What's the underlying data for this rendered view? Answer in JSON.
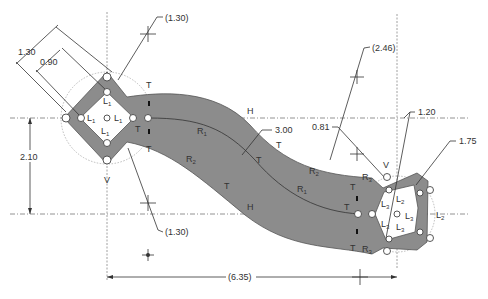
{
  "drawing": {
    "dimensions": {
      "diamond_outer": "1.30",
      "diamond_inner": "0.90",
      "top_ref": "(1.30)",
      "bottom_ref": "(1.30)",
      "vertical_offset": "2.10",
      "arm_width": "3.00",
      "r2_ref": "(2.46)",
      "arc_offset": "0.81",
      "pent_inner": "1.20",
      "pent_outer": "1.75",
      "horizontal_span": "(6.35)"
    },
    "labels": {
      "T": "T",
      "H": "H",
      "V": "V",
      "R": "R",
      "L": "L",
      "sub1": "1",
      "sub2": "2",
      "sub3": "3"
    },
    "colors": {
      "band": "#8c8c8c",
      "line": "#333333",
      "centerline": "#777777",
      "background": "#ffffff"
    }
  }
}
